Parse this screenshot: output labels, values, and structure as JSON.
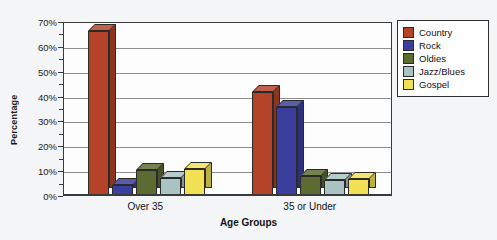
{
  "chart_data": {
    "type": "bar",
    "title": "",
    "xlabel": "Age Groups",
    "ylabel": "Percentage",
    "categories": [
      "Over 35",
      "35 or Under"
    ],
    "series": [
      {
        "name": "Country",
        "color": "#B5432A",
        "values": [
          66.0,
          41.5
        ]
      },
      {
        "name": "Rock",
        "color": "#3B3E9E",
        "values": [
          4.0,
          35.5
        ]
      },
      {
        "name": "Oldies",
        "color": "#5B6B32",
        "values": [
          10.0,
          7.5
        ]
      },
      {
        "name": "Jazz/Blues",
        "color": "#A9C2C2",
        "values": [
          7.0,
          6.0
        ]
      },
      {
        "name": "Gospel",
        "color": "#F2E155",
        "values": [
          10.5,
          6.5
        ]
      }
    ],
    "ylim": [
      0,
      70
    ],
    "y_major_step": 10,
    "y_minor_step": 5,
    "ytick_labels": [
      "0%",
      "10%",
      "20%",
      "30%",
      "40%",
      "50%",
      "60%",
      "70%"
    ],
    "grid": true,
    "legend_position": "right",
    "value_suffix": "%"
  },
  "legend": {
    "items": [
      {
        "label": "Country"
      },
      {
        "label": "Rock"
      },
      {
        "label": "Oldies"
      },
      {
        "label": "Jazz/Blues"
      },
      {
        "label": "Gospel"
      }
    ]
  }
}
